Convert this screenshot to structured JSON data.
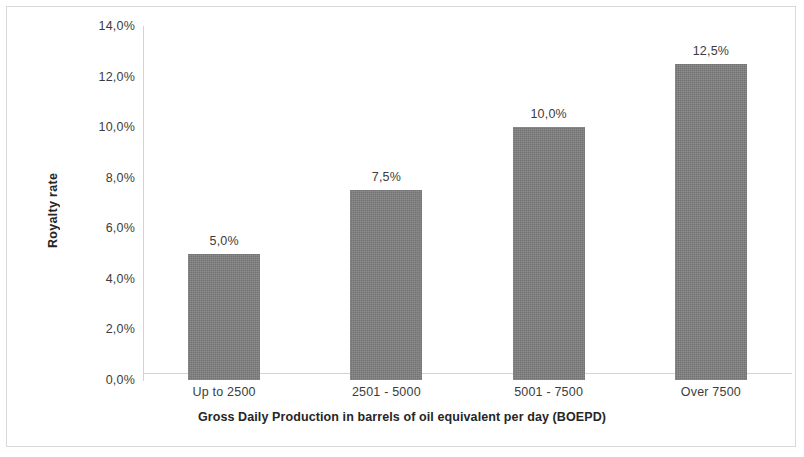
{
  "chart_data": {
    "type": "bar",
    "title": "",
    "categories": [
      "Up to 2500",
      "2501 - 5000",
      "5001 - 7500",
      "Over 7500"
    ],
    "values": [
      5.0,
      7.5,
      10.0,
      12.5
    ],
    "data_labels": [
      "5,0%",
      "7,5%",
      "10,0%",
      "12,5%"
    ],
    "xlabel": "Gross Daily Production in barrels of oil equivalent per day (BOEPD)",
    "ylabel": "Royalty rate",
    "ylim": [
      0,
      14
    ],
    "ytick_values": [
      0,
      2,
      4,
      6,
      8,
      10,
      12,
      14
    ],
    "ytick_labels": [
      "0,0%",
      "2,0%",
      "4,0%",
      "6,0%",
      "8,0%",
      "10,0%",
      "12,0%",
      "14,0%"
    ],
    "grid": false,
    "legend": false,
    "bar_color": "#808080",
    "axis_color": "#d3d3d3",
    "border_color": "#d9d9d9",
    "background_color": "#ffffff"
  }
}
